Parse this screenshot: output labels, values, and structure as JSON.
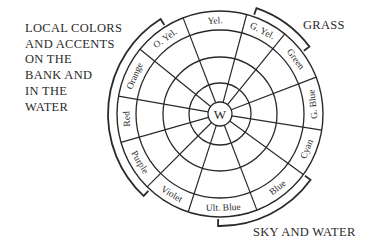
{
  "captions": {
    "left": [
      "LOCAL COLORS",
      "AND ACCENTS",
      "ON THE",
      "BANK AND",
      "IN THE",
      "WATER"
    ],
    "grass": "GRASS",
    "sky_water": "SKY AND WATER"
  },
  "wheel": {
    "center_label": "W",
    "center": [
      220,
      114
    ],
    "ring_radii": [
      103,
      84,
      57,
      31,
      12
    ],
    "spoke_angles_deg": [
      -111,
      -75,
      -51,
      -21,
      9,
      36,
      69,
      108,
      135,
      164,
      190,
      219
    ],
    "segments": [
      {
        "label": "Yel.",
        "mid_angle": -93,
        "rotate": -3
      },
      {
        "label": "G. Yel.",
        "mid_angle": -63,
        "rotate": 27
      },
      {
        "label": "Green",
        "mid_angle": -36,
        "rotate": 54
      },
      {
        "label": "G. Blue",
        "mid_angle": -6,
        "rotate": -96
      },
      {
        "label": "Cyan",
        "mid_angle": 22,
        "rotate": -68
      },
      {
        "label": "Blue",
        "mid_angle": 52,
        "rotate": -38
      },
      {
        "label": "Ult. Blue",
        "mid_angle": 88,
        "rotate": -2
      },
      {
        "label": "Violet",
        "mid_angle": 121,
        "rotate": 31
      },
      {
        "label": "Purple",
        "mid_angle": 149,
        "rotate": 59
      },
      {
        "label": "Red",
        "mid_angle": 177,
        "rotate": -93
      },
      {
        "label": "Orange",
        "mid_angle": 204,
        "rotate": -66
      },
      {
        "label": "O. Yel.",
        "mid_angle": 234,
        "rotate": -36
      }
    ]
  },
  "brackets": {
    "left": {
      "from_deg": 133,
      "to_deg": 238,
      "radius": 112
    },
    "grass": {
      "from_deg": -71,
      "to_deg": -37,
      "radius": 112
    },
    "sky_water": {
      "from_deg": 36,
      "to_deg": 91,
      "radius": 112
    }
  },
  "colors": {
    "ink": "#2a2a2a",
    "background": "#ffffff"
  }
}
